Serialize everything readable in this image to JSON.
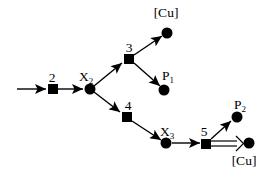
{
  "figure": {
    "type": "reaction-network-diagram",
    "background": "#ffffff",
    "ink": "#000000",
    "labels": {
      "step2": "2",
      "step3": "3",
      "step4": "4",
      "step5": "5",
      "x2": {
        "base": "X",
        "sub": "2"
      },
      "x3": {
        "base": "X",
        "sub": "3"
      },
      "p1": {
        "base": "P",
        "sub": "1"
      },
      "p2": {
        "base": "P",
        "sub": "2"
      },
      "cu_top": "[Cu]",
      "cu_bottom": "[Cu]"
    },
    "nodes": [
      {
        "id": "step2",
        "shape": "square"
      },
      {
        "id": "X2",
        "shape": "circle"
      },
      {
        "id": "step3",
        "shape": "square"
      },
      {
        "id": "Cu-top",
        "shape": "circle"
      },
      {
        "id": "P1",
        "shape": "circle"
      },
      {
        "id": "step4",
        "shape": "square"
      },
      {
        "id": "X3",
        "shape": "circle"
      },
      {
        "id": "step5",
        "shape": "square"
      },
      {
        "id": "P2",
        "shape": "circle"
      },
      {
        "id": "Cu-bottom",
        "shape": "circle"
      }
    ],
    "edges": [
      {
        "from": "feed",
        "to": "step2",
        "arrow": "filled"
      },
      {
        "from": "step2",
        "to": "X2",
        "arrow": "filled"
      },
      {
        "from": "X2",
        "to": "step3",
        "arrow": "filled"
      },
      {
        "from": "step3",
        "to": "Cu-top",
        "arrow": "filled"
      },
      {
        "from": "step3",
        "to": "P1",
        "arrow": "filled"
      },
      {
        "from": "X2",
        "to": "step4",
        "arrow": "filled"
      },
      {
        "from": "step4",
        "to": "X3",
        "arrow": "filled"
      },
      {
        "from": "X3",
        "to": "step5",
        "arrow": "filled"
      },
      {
        "from": "step5",
        "to": "P2",
        "arrow": "filled"
      },
      {
        "from": "step5",
        "to": "Cu-bottom",
        "arrow": "double-open"
      }
    ]
  }
}
